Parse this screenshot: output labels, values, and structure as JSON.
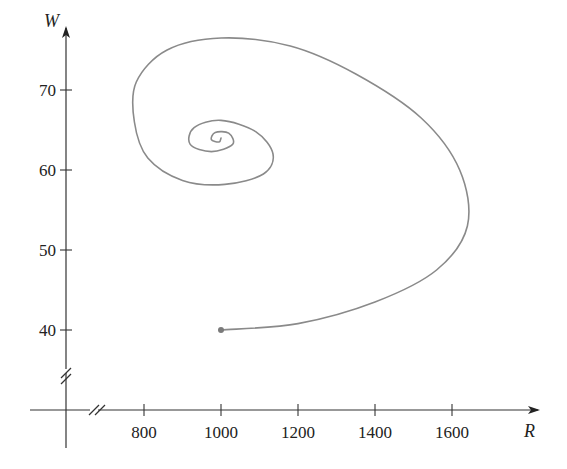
{
  "chart_data": {
    "type": "line",
    "title": "",
    "xlabel": "R",
    "ylabel": "W",
    "x_ticks": [
      800,
      1000,
      1200,
      1400,
      1600
    ],
    "y_ticks": [
      40,
      50,
      60,
      70
    ],
    "x_tick_labels": [
      "800",
      "1000",
      "1200",
      "1400",
      "1600"
    ],
    "y_tick_labels": [
      "40",
      "50",
      "60",
      "70"
    ],
    "axis_breaks": {
      "x": true,
      "y": true
    },
    "grid": false,
    "legend": null,
    "start_point": {
      "R": 1000,
      "W": 40
    },
    "equilibrium": {
      "R": 990,
      "W": 64
    },
    "series": [
      {
        "name": "phase trajectory",
        "description": "Spiral trajectory starting at (1000, 40), sweeping right to R≈1640, up to W≈76.5, left to R≈775, and spiraling inward toward equilibrium near (990, 64)",
        "points": [
          {
            "R": 1000,
            "W": 40
          },
          {
            "R": 1200,
            "W": 40.8
          },
          {
            "R": 1400,
            "W": 43.5
          },
          {
            "R": 1560,
            "W": 47.5
          },
          {
            "R": 1640,
            "W": 53
          },
          {
            "R": 1620,
            "W": 60
          },
          {
            "R": 1520,
            "W": 66.5
          },
          {
            "R": 1350,
            "W": 72
          },
          {
            "R": 1180,
            "W": 75.5
          },
          {
            "R": 1000,
            "W": 76.5
          },
          {
            "R": 860,
            "W": 75
          },
          {
            "R": 780,
            "W": 71
          },
          {
            "R": 775,
            "W": 66
          },
          {
            "R": 810,
            "W": 61.5
          },
          {
            "R": 900,
            "W": 58.7
          },
          {
            "R": 1010,
            "W": 58.2
          },
          {
            "R": 1110,
            "W": 59.5
          },
          {
            "R": 1135,
            "W": 62
          },
          {
            "R": 1090,
            "W": 64.8
          },
          {
            "R": 1000,
            "W": 66.2
          },
          {
            "R": 930,
            "W": 65.3
          },
          {
            "R": 920,
            "W": 63.2
          },
          {
            "R": 975,
            "W": 62.3
          },
          {
            "R": 1030,
            "W": 63.2
          },
          {
            "R": 1020,
            "W": 64.6
          },
          {
            "R": 985,
            "W": 64.7
          },
          {
            "R": 975,
            "W": 63.8
          },
          {
            "R": 995,
            "W": 63.5
          },
          {
            "R": 1000,
            "W": 64
          }
        ]
      }
    ],
    "colors": {
      "curve": "#8a8a8a",
      "axes": "#333333",
      "start_dot": "#7a7a7a"
    }
  }
}
